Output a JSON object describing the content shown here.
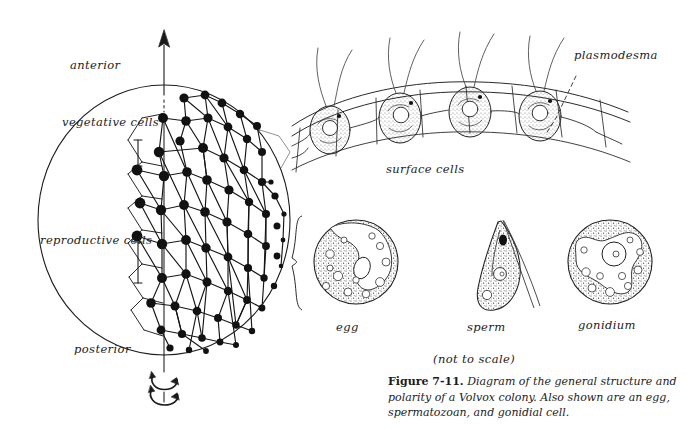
{
  "figure": {
    "number": "Figure 7-11.",
    "caption_text": "Diagram of the general structure and polarity of a Volvox colony. Also shown are an egg, spermatozoan, and gonidial cell.",
    "organism": "Volvox"
  },
  "colony_diagram": {
    "labels": {
      "anterior": "anterior",
      "vegetative_cells": "vegetative cells",
      "reproductive_cells": "reproductive cells",
      "posterior": "posterior"
    }
  },
  "surface_diagram": {
    "labels": {
      "plasmodesma": "plasmodesma",
      "surface_cells": "surface cells"
    },
    "cell_count": 4
  },
  "cell_types": {
    "egg": "egg",
    "sperm": "sperm",
    "gonidium": "gonidium",
    "scale_note": "(not to scale)"
  },
  "style": {
    "ink": "#1b1b1b",
    "paper": "#ffffff"
  }
}
